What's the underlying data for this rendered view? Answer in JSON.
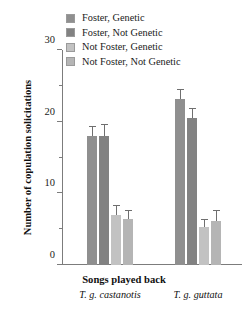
{
  "chart_data": {
    "type": "bar",
    "title": "",
    "xlabel": "Songs played back",
    "ylabel": "Number of copulation solicitations",
    "ylim": [
      0,
      30
    ],
    "yticks": [
      0,
      10,
      20,
      30
    ],
    "yticks_minor": [
      5,
      15,
      25
    ],
    "grid": false,
    "legend_position": "top-center",
    "categories": [
      "T. g. castanotis",
      "T. g. guttata"
    ],
    "series": [
      {
        "name": "Foster, Genetic",
        "color": "#8f8f8f",
        "values": [
          18.0,
          23.2
        ],
        "errors": [
          1.3,
          1.2
        ]
      },
      {
        "name": "Foster, Not Genetic",
        "color": "#828282",
        "values": [
          18.0,
          20.5
        ],
        "errors": [
          1.5,
          1.3
        ]
      },
      {
        "name": "Not Foster, Genetic",
        "color": "#c2c2c2",
        "values": [
          7.0,
          5.3
        ],
        "errors": [
          1.3,
          1.0
        ]
      },
      {
        "name": "Not Foster, Not Genetic",
        "color": "#b5b5b5",
        "values": [
          6.4,
          6.1
        ],
        "errors": [
          1.2,
          1.5
        ]
      }
    ]
  },
  "legend": {
    "items": [
      {
        "label": "Foster, Genetic",
        "color": "#8f8f8f"
      },
      {
        "label": "Foster, Not Genetic",
        "color": "#828282"
      },
      {
        "label": "Not Foster, Genetic",
        "color": "#c2c2c2"
      },
      {
        "label": "Not Foster, Not Genetic",
        "color": "#b5b5b5"
      }
    ]
  },
  "axes": {
    "y_title": "Number of copulation solicitations",
    "x_title": "Songs played back",
    "y_tick_labels": [
      "0",
      "10",
      "20",
      "30"
    ]
  },
  "species_labels": [
    "T. g. castanotis",
    "T. g. guttata"
  ]
}
